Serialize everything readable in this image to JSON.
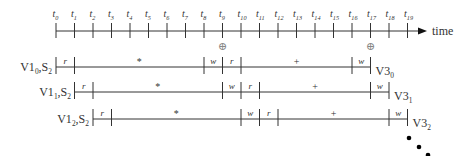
{
  "timeline": {
    "axis_label": "time",
    "ticks": [
      "t0",
      "t1",
      "t2",
      "t3",
      "t4",
      "t5",
      "t6",
      "t7",
      "t8",
      "t9",
      "t10",
      "t11",
      "t12",
      "t13",
      "t14",
      "t15",
      "t16",
      "t17",
      "t18",
      "t19"
    ],
    "tick_subscripts": [
      "0",
      "1",
      "2",
      "3",
      "4",
      "5",
      "6",
      "7",
      "8",
      "9",
      "10",
      "11",
      "12",
      "13",
      "14",
      "15",
      "16",
      "17",
      "18",
      "19"
    ],
    "tick_letter": "t"
  },
  "markers": [
    {
      "symbol": "⊕",
      "at_tick": 9
    },
    {
      "symbol": "⊕",
      "at_tick": 17
    }
  ],
  "rows": [
    {
      "left_label": {
        "main": "V1",
        "sub": "0",
        "rest": ",S",
        "rest_sub": "2"
      },
      "right_label": {
        "main": "V3",
        "sub": "0"
      },
      "segments": [
        {
          "label": "r",
          "from": 0,
          "to": 1
        },
        {
          "label": "*",
          "from": 1,
          "to": 8
        },
        {
          "label": "w",
          "from": 8,
          "to": 9
        },
        {
          "label": "r",
          "from": 9,
          "to": 10
        },
        {
          "label": "+",
          "from": 10,
          "to": 16
        },
        {
          "label": "w",
          "from": 16,
          "to": 17
        }
      ]
    },
    {
      "left_label": {
        "main": "V1",
        "sub": "1",
        "rest": ",S",
        "rest_sub": "2"
      },
      "right_label": {
        "main": "V3",
        "sub": "1"
      },
      "segments": [
        {
          "label": "r",
          "from": 1,
          "to": 2
        },
        {
          "label": "*",
          "from": 2,
          "to": 9
        },
        {
          "label": "w",
          "from": 9,
          "to": 10
        },
        {
          "label": "r",
          "from": 10,
          "to": 11
        },
        {
          "label": "+",
          "from": 11,
          "to": 17
        },
        {
          "label": "w",
          "from": 17,
          "to": 18
        }
      ]
    },
    {
      "left_label": {
        "main": "V1",
        "sub": "2",
        "rest": ",S",
        "rest_sub": "2"
      },
      "right_label": {
        "main": "V3",
        "sub": "2"
      },
      "segments": [
        {
          "label": "r",
          "from": 2,
          "to": 3
        },
        {
          "label": "*",
          "from": 3,
          "to": 10
        },
        {
          "label": "w",
          "from": 10,
          "to": 11
        },
        {
          "label": "r",
          "from": 11,
          "to": 12
        },
        {
          "label": "+",
          "from": 12,
          "to": 18
        },
        {
          "label": "w",
          "from": 18,
          "to": 19
        }
      ]
    }
  ],
  "continuation": "⋱"
}
